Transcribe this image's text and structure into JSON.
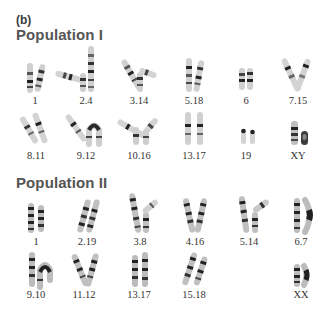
{
  "panel_label": "(b)",
  "populations": [
    {
      "title": "Population I",
      "title_top": 26,
      "rows": [
        {
          "label_y": 95,
          "items": [
            {
              "label": "1",
              "cx": 35
            },
            {
              "label": "2.4",
              "cx": 86
            },
            {
              "label": "3.14",
              "cx": 139
            },
            {
              "label": "5.18",
              "cx": 194
            },
            {
              "label": "6",
              "cx": 246
            },
            {
              "label": "7.15",
              "cx": 298
            }
          ]
        },
        {
          "label_y": 150,
          "items": [
            {
              "label": "8.11",
              "cx": 36
            },
            {
              "label": "9.12",
              "cx": 86
            },
            {
              "label": "10.16",
              "cx": 139
            },
            {
              "label": "13.17",
              "cx": 194
            },
            {
              "label": "19",
              "cx": 246
            },
            {
              "label": "XY",
              "cx": 298
            }
          ]
        }
      ]
    },
    {
      "title": "Population II",
      "title_top": 174,
      "rows": [
        {
          "label_y": 236,
          "items": [
            {
              "label": "1",
              "cx": 36
            },
            {
              "label": "2.19",
              "cx": 87
            },
            {
              "label": "3.8",
              "cx": 140
            },
            {
              "label": "4.16",
              "cx": 195
            },
            {
              "label": "5.14",
              "cx": 249
            },
            {
              "label": "6.7",
              "cx": 301
            }
          ]
        },
        {
          "label_y": 289,
          "items": [
            {
              "label": "9.10",
              "cx": 36
            },
            {
              "label": "11.12",
              "cx": 84
            },
            {
              "label": "13.17",
              "cx": 139
            },
            {
              "label": "15.18",
              "cx": 194
            },
            {
              "label": "XX",
              "cx": 301
            }
          ]
        }
      ]
    }
  ],
  "colors": {
    "background": "#ffffff",
    "chromatid": "#c9c9c9",
    "band_dark": "#1e1e1e",
    "band_mid": "#6f6f6f",
    "label": "#333333",
    "title": "#555555"
  }
}
